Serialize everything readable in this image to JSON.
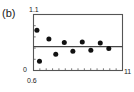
{
  "figure": {
    "panel_label": "(b)",
    "axis_color": "#555555",
    "point_color": "#111111",
    "line_color": "#444444",
    "background": "#ffffff"
  },
  "chart_data": {
    "type": "scatter",
    "title": "(b)",
    "xlabel": "",
    "ylabel": "",
    "xlim": [
      0.6,
      11
    ],
    "ylim": [
      0,
      1.1
    ],
    "grid": false,
    "legend": null,
    "x_tick_labels": [
      "0.6",
      "11"
    ],
    "y_tick_labels": [
      "0",
      "1.1"
    ],
    "x_minor_tick_count": 13,
    "y_minor_tick_count": 4,
    "reference_line": {
      "orientation": "horizontal",
      "y": 0.47
    },
    "series": [
      {
        "name": "data",
        "marker": "filled-circle",
        "x": [
          1.0,
          1.3,
          2.4,
          3.2,
          4.2,
          5.2,
          6.3,
          7.3,
          8.4,
          9.4
        ],
        "y": [
          0.79,
          0.18,
          0.62,
          0.32,
          0.55,
          0.38,
          0.56,
          0.4,
          0.54,
          0.43
        ]
      }
    ]
  }
}
